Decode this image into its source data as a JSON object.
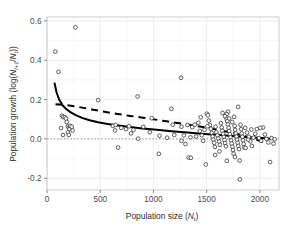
{
  "chart_data": {
    "type": "scatter",
    "title": "",
    "xlabel": "Population size (Nt)",
    "xlabel_main": "Population size (",
    "xlabel_var": "N",
    "xlabel_sub": "t",
    "xlabel_close": ")",
    "ylabel": "Population growth (log(Nt+1/Nt))",
    "ylabel_pre": "Population growth (log(",
    "ylabel_var1": "N",
    "ylabel_sub1": "t+1",
    "ylabel_slash": "/",
    "ylabel_var2": "N",
    "ylabel_sub2": "t",
    "ylabel_close": "))",
    "xlim": [
      0,
      2180
    ],
    "ylim": [
      -0.26,
      0.62
    ],
    "xticks": [
      0,
      500,
      1000,
      1500,
      2000
    ],
    "xticklabels": [
      "0",
      "500",
      "1000",
      "1500",
      "2000"
    ],
    "yticks": [
      -0.2,
      0.0,
      0.2,
      0.4,
      0.6
    ],
    "yticklabels": [
      "-0.2",
      "0.0",
      "0.2",
      "0.4",
      "0.6"
    ],
    "grid": true,
    "grid_major_color": "#e8e8e8",
    "grid_minor_color": "#f3f3f3",
    "panel_border_color": "#c8c8c8",
    "marker": "open-circle",
    "marker_edge_color": "#2b2b2b",
    "marker_face_color": "#ffffff",
    "marker_size": 3.0,
    "zero_line": {
      "y": 0.0,
      "style": "dotted",
      "color": "#6b6b6b"
    },
    "series": [
      {
        "name": "observations",
        "type": "scatter",
        "points": [
          [
            78,
            0.444
          ],
          [
            108,
            0.341
          ],
          [
            267,
            0.567
          ],
          [
            140,
            0.118
          ],
          [
            152,
            0.112
          ],
          [
            168,
            0.11
          ],
          [
            178,
            0.103
          ],
          [
            185,
            0.086
          ],
          [
            196,
            0.063
          ],
          [
            204,
            0.058
          ],
          [
            211,
            0.05
          ],
          [
            197,
            0.033
          ],
          [
            218,
            0.066
          ],
          [
            232,
            0.062
          ],
          [
            241,
            0.043
          ],
          [
            205,
            0.02
          ],
          [
            150,
            0.02
          ],
          [
            132,
            0.055
          ],
          [
            481,
            0.197
          ],
          [
            619,
            0.066
          ],
          [
            645,
            0.071
          ],
          [
            640,
            0.043
          ],
          [
            668,
            -0.044
          ],
          [
            698,
            0.056
          ],
          [
            742,
            0.05
          ],
          [
            771,
            0.064
          ],
          [
            789,
            0.028
          ],
          [
            812,
            0.046
          ],
          [
            851,
            0.216
          ],
          [
            857,
            0.001
          ],
          [
            905,
            0.062
          ],
          [
            966,
            0.034
          ],
          [
            984,
            0.105
          ],
          [
            1051,
            -0.076
          ],
          [
            1057,
            0.016
          ],
          [
            1169,
            0.153
          ],
          [
            1181,
            0.072
          ],
          [
            1259,
            0.311
          ],
          [
            1264,
            0.062
          ],
          [
            1286,
            0.018
          ],
          [
            1301,
            -0.026
          ],
          [
            1320,
            0.071
          ],
          [
            1331,
            -0.095
          ],
          [
            1348,
            0.008
          ],
          [
            1364,
            0.06
          ],
          [
            1388,
            0.072
          ],
          [
            1401,
            0.012
          ],
          [
            1422,
            0.082
          ],
          [
            1436,
            0.04
          ],
          [
            1455,
            0.018
          ],
          [
            1468,
            -0.01
          ],
          [
            1480,
            0.046
          ],
          [
            1492,
            -0.13
          ],
          [
            1502,
            0.128
          ],
          [
            1512,
            0.12
          ],
          [
            1521,
            0.093
          ],
          [
            1530,
            0.07
          ],
          [
            1540,
            0.051
          ],
          [
            1548,
            0.031
          ],
          [
            1556,
            0.012
          ],
          [
            1563,
            -0.004
          ],
          [
            1571,
            -0.02
          ],
          [
            1578,
            -0.041
          ],
          [
            1584,
            0.062
          ],
          [
            1592,
            0.034
          ],
          [
            1601,
            0.018
          ],
          [
            1610,
            0.002
          ],
          [
            1618,
            -0.014
          ],
          [
            1626,
            -0.03
          ],
          [
            1634,
            0.08
          ],
          [
            1641,
            0.058
          ],
          [
            1648,
            0.041
          ],
          [
            1655,
            0.026
          ],
          [
            1662,
            0.01
          ],
          [
            1668,
            -0.006
          ],
          [
            1674,
            -0.022
          ],
          [
            1681,
            -0.038
          ],
          [
            1688,
            0.1
          ],
          [
            1694,
            0.09
          ],
          [
            1700,
            0.073
          ],
          [
            1706,
            0.056
          ],
          [
            1712,
            0.04
          ],
          [
            1718,
            0.024
          ],
          [
            1724,
            0.008
          ],
          [
            1730,
            -0.008
          ],
          [
            1736,
            -0.024
          ],
          [
            1742,
            -0.04
          ],
          [
            1748,
            -0.057
          ],
          [
            1754,
            -0.075
          ],
          [
            1758,
            0.112
          ],
          [
            1763,
            0.066
          ],
          [
            1768,
            0.046
          ],
          [
            1774,
            0.028
          ],
          [
            1780,
            0.012
          ],
          [
            1786,
            -0.004
          ],
          [
            1792,
            -0.02
          ],
          [
            1798,
            -0.036
          ],
          [
            1804,
            -0.052
          ],
          [
            1810,
            -0.11
          ],
          [
            1812,
            -0.206
          ],
          [
            1818,
            0.072
          ],
          [
            1824,
            0.049
          ],
          [
            1830,
            0.028
          ],
          [
            1836,
            0.01
          ],
          [
            1842,
            -0.008
          ],
          [
            1848,
            -0.026
          ],
          [
            1854,
            -0.044
          ],
          [
            1796,
            0.163
          ],
          [
            1702,
            0.138
          ],
          [
            1688,
            0.126
          ],
          [
            1862,
            0.056
          ],
          [
            1880,
            0.032
          ],
          [
            1896,
            0.01
          ],
          [
            1910,
            -0.012
          ],
          [
            1925,
            -0.036
          ],
          [
            1940,
            0.006
          ],
          [
            1956,
            0.026
          ],
          [
            1972,
            0.05
          ],
          [
            1992,
            0.004
          ],
          [
            2012,
            -0.01
          ],
          [
            2030,
            0.058
          ],
          [
            2048,
            0.022
          ],
          [
            2062,
            0.0
          ],
          [
            2080,
            -0.018
          ],
          [
            2096,
            -0.118
          ],
          [
            2110,
            0.004
          ],
          [
            2128,
            -0.024
          ],
          [
            2140,
            -0.002
          ],
          [
            1352,
            -0.096
          ],
          [
            1508,
            0.064
          ],
          [
            1444,
            0.11
          ],
          [
            1264,
            -0.01
          ],
          [
            1196,
            0.02
          ],
          [
            1128,
            0.006
          ],
          [
            1650,
            0.132
          ],
          [
            1672,
            0.116
          ],
          [
            1712,
            0.104
          ],
          [
            1740,
            0.086
          ],
          [
            1766,
            -0.092
          ],
          [
            1690,
            -0.112
          ],
          [
            1620,
            -0.064
          ],
          [
            1580,
            -0.082
          ],
          [
            1920,
            0.048
          ],
          [
            2004,
            0.056
          ],
          [
            1866,
            -0.046
          ],
          [
            1890,
            -0.004
          ]
        ]
      },
      {
        "name": "fitted-model-solid",
        "type": "line",
        "style": "solid",
        "color": "#000000",
        "width": 2.0,
        "points": [
          [
            70,
            0.286
          ],
          [
            90,
            0.236
          ],
          [
            115,
            0.199
          ],
          [
            145,
            0.172
          ],
          [
            180,
            0.152
          ],
          [
            220,
            0.136
          ],
          [
            270,
            0.121
          ],
          [
            330,
            0.107
          ],
          [
            400,
            0.095
          ],
          [
            480,
            0.085
          ],
          [
            570,
            0.076
          ],
          [
            670,
            0.068
          ],
          [
            780,
            0.06
          ],
          [
            900,
            0.053
          ],
          [
            1030,
            0.046
          ],
          [
            1170,
            0.039
          ],
          [
            1320,
            0.032
          ],
          [
            1480,
            0.025
          ],
          [
            1650,
            0.018
          ],
          [
            1830,
            0.011
          ],
          [
            2020,
            0.005
          ],
          [
            2140,
            0.0
          ]
        ]
      },
      {
        "name": "fitted-model-dashed",
        "type": "line",
        "style": "dashed",
        "color": "#000000",
        "width": 2.0,
        "dash_pattern": "7,5",
        "points": [
          [
            80,
            0.176
          ],
          [
            180,
            0.172
          ],
          [
            300,
            0.162
          ],
          [
            420,
            0.15
          ],
          [
            540,
            0.138
          ],
          [
            660,
            0.127
          ],
          [
            780,
            0.117
          ],
          [
            900,
            0.108
          ],
          [
            1020,
            0.098
          ],
          [
            1140,
            0.088
          ],
          [
            1260,
            0.078
          ],
          [
            1380,
            0.068
          ],
          [
            1500,
            0.057
          ],
          [
            1620,
            0.045
          ],
          [
            1740,
            0.031
          ],
          [
            1860,
            0.014
          ],
          [
            1960,
            -0.002
          ],
          [
            2040,
            -0.018
          ]
        ]
      }
    ]
  }
}
